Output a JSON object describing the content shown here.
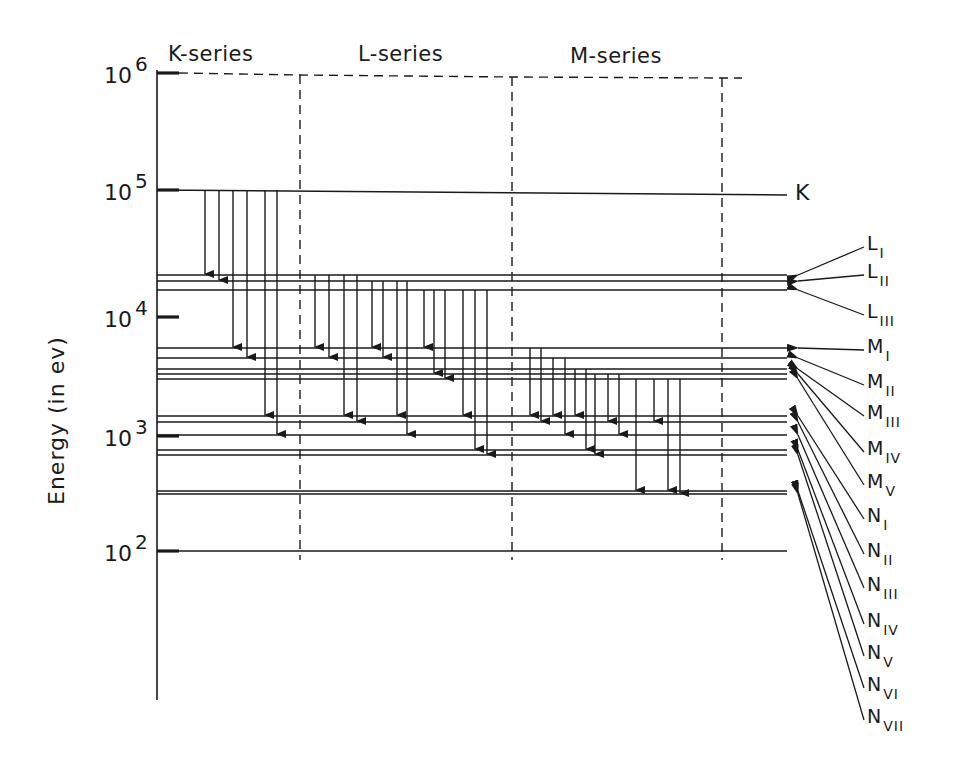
{
  "chart_data": {
    "type": "energy-level-diagram",
    "title": "",
    "ylabel": "Energy (in ev)",
    "yscale": "log",
    "ylim": [
      10,
      1000000
    ],
    "y_ticks": [
      {
        "label": "10",
        "exp": "6",
        "y": 73
      },
      {
        "label": "10",
        "exp": "5",
        "y": 190
      },
      {
        "label": "10",
        "exp": "4",
        "y": 317
      },
      {
        "label": "10",
        "exp": "3",
        "y": 436
      },
      {
        "label": "10",
        "exp": "2",
        "y": 551
      }
    ],
    "series_headers": [
      {
        "label": "K-series",
        "x": 168
      },
      {
        "label": "L-series",
        "x": 358
      },
      {
        "label": "M-series",
        "x": 570
      }
    ],
    "levels": [
      {
        "name": "K",
        "base": "K",
        "sub": "",
        "y": 190,
        "y_end": 195
      },
      {
        "name": "L_I",
        "base": "L",
        "sub": "I",
        "y": 275
      },
      {
        "name": "L_II",
        "base": "L",
        "sub": "II",
        "y": 281
      },
      {
        "name": "L_III",
        "base": "L",
        "sub": "III",
        "y": 290
      },
      {
        "name": "M_I",
        "base": "M",
        "sub": "I",
        "y": 348
      },
      {
        "name": "M_II",
        "base": "M",
        "sub": "II",
        "y": 358
      },
      {
        "name": "M_III",
        "base": "M",
        "sub": "III",
        "y": 369
      },
      {
        "name": "M_IV",
        "base": "M",
        "sub": "IV",
        "y": 374
      },
      {
        "name": "M_V",
        "base": "M",
        "sub": "V",
        "y": 379
      },
      {
        "name": "N_I",
        "base": "N",
        "sub": "I",
        "y": 416
      },
      {
        "name": "N_II",
        "base": "N",
        "sub": "II",
        "y": 422
      },
      {
        "name": "N_III",
        "base": "N",
        "sub": "III",
        "y": 435
      },
      {
        "name": "N_IV",
        "base": "N",
        "sub": "IV",
        "y": 450
      },
      {
        "name": "N_V",
        "base": "N",
        "sub": "V",
        "y": 455
      },
      {
        "name": "N_VI",
        "base": "N",
        "sub": "VI",
        "y": 491
      },
      {
        "name": "N_VII",
        "base": "N",
        "sub": "VII",
        "y": 494
      }
    ],
    "labels_right": [
      {
        "level": "L_I",
        "base": "L",
        "sub": "I",
        "label_y": 245
      },
      {
        "level": "L_II",
        "base": "L",
        "sub": "II",
        "label_y": 273
      },
      {
        "level": "L_III",
        "base": "L",
        "sub": "III",
        "label_y": 313
      },
      {
        "level": "M_I",
        "base": "M",
        "sub": "I",
        "label_y": 348
      },
      {
        "level": "M_II",
        "base": "M",
        "sub": "II",
        "label_y": 383
      },
      {
        "level": "M_III",
        "base": "M",
        "sub": "III",
        "label_y": 414
      },
      {
        "level": "M_IV",
        "base": "M",
        "sub": "IV",
        "label_y": 450
      },
      {
        "level": "M_V",
        "base": "M",
        "sub": "V",
        "label_y": 483
      },
      {
        "level": "N_I",
        "base": "N",
        "sub": "I",
        "label_y": 517
      },
      {
        "level": "N_II",
        "base": "N",
        "sub": "II",
        "label_y": 552
      },
      {
        "level": "N_III",
        "base": "N",
        "sub": "III",
        "label_y": 586
      },
      {
        "level": "N_IV",
        "base": "N",
        "sub": "IV",
        "label_y": 622
      },
      {
        "level": "N_V",
        "base": "N",
        "sub": "V",
        "label_y": 654
      },
      {
        "level": "N_VI",
        "base": "N",
        "sub": "VI",
        "label_y": 686
      },
      {
        "level": "N_VII",
        "base": "N",
        "sub": "VII",
        "label_y": 718
      }
    ],
    "transitions": {
      "K_series": [
        {
          "from": "K",
          "to": "L_I",
          "x": 205
        },
        {
          "from": "K",
          "to": "L_II",
          "x": 219
        },
        {
          "from": "K",
          "to": "M_I",
          "x": 233
        },
        {
          "from": "K",
          "to": "M_II",
          "x": 247
        },
        {
          "from": "K",
          "to": "N_I",
          "x": 265
        },
        {
          "from": "K",
          "to": "N_III",
          "x": 277
        }
      ],
      "L_series": [
        {
          "from": "L_I",
          "to": "M_I",
          "x": 315
        },
        {
          "from": "L_I",
          "to": "M_II",
          "x": 329
        },
        {
          "from": "L_I",
          "to": "N_I",
          "x": 344
        },
        {
          "from": "L_I",
          "to": "N_II",
          "x": 357
        },
        {
          "from": "L_II",
          "to": "M_I",
          "x": 372
        },
        {
          "from": "L_II",
          "to": "M_II",
          "x": 383
        },
        {
          "from": "L_II",
          "to": "N_I",
          "x": 397
        },
        {
          "from": "L_II",
          "to": "N_III",
          "x": 407
        },
        {
          "from": "L_III",
          "to": "M_I",
          "x": 424
        },
        {
          "from": "L_III",
          "to": "M_IV",
          "x": 434
        },
        {
          "from": "L_III",
          "to": "M_V",
          "x": 445
        },
        {
          "from": "L_III",
          "to": "N_I",
          "x": 463
        },
        {
          "from": "L_III",
          "to": "N_IV",
          "x": 475
        },
        {
          "from": "L_III",
          "to": "N_V",
          "x": 487
        }
      ],
      "M_series": [
        {
          "from": "M_I",
          "to": "N_I",
          "x": 530
        },
        {
          "from": "M_I",
          "to": "N_II",
          "x": 541
        },
        {
          "from": "M_II",
          "to": "N_I",
          "x": 553
        },
        {
          "from": "M_II",
          "to": "N_III",
          "x": 565
        },
        {
          "from": "M_III",
          "to": "N_I",
          "x": 575
        },
        {
          "from": "M_III",
          "to": "N_IV",
          "x": 586
        },
        {
          "from": "M_IV",
          "to": "N_V",
          "x": 595
        },
        {
          "from": "M_IV",
          "to": "N_II",
          "x": 608
        },
        {
          "from": "M_IV",
          "to": "N_III",
          "x": 619
        },
        {
          "from": "M_V",
          "to": "N_VI",
          "x": 636
        },
        {
          "from": "M_V",
          "to": "N_II",
          "x": 654
        },
        {
          "from": "M_V",
          "to": "N_VI",
          "x": 668
        },
        {
          "from": "M_V",
          "to": "N_VII",
          "x": 680
        }
      ]
    }
  },
  "axis": {
    "title": "Energy (in ev)"
  },
  "headers": {
    "k_series": "K-series",
    "l_series": "L-series",
    "m_series": "M-series"
  },
  "k_label": "K"
}
